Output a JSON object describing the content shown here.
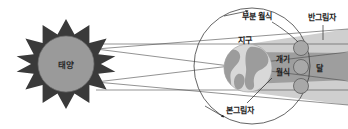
{
  "diagram": {
    "width": 348,
    "height": 129,
    "background_color": "#ffffff"
  },
  "labels": {
    "sun": "태양",
    "earth": "지구",
    "moon": "달",
    "partial_eclipse": "부분 월식",
    "penumbra": "반그림자",
    "total_eclipse_line1": "개기",
    "total_eclipse_line2": "월식",
    "umbra": "본그림자"
  },
  "colors": {
    "sun_spikes": "#3a3a3a",
    "sun_disc": "#9a9a9a",
    "earth_ocean": "#d8d8d8",
    "earth_land": "#9c9c9c",
    "moon_fill": "#a8a8a8",
    "moon_stroke": "#5a5a5a",
    "penumbra_band": "#cfcfcf",
    "umbra_band": "#9e9e9e",
    "ray_line": "#4a4a4a",
    "orbit_line": "#3d3d3d",
    "text": "#1c1c1c"
  },
  "bodies": {
    "sun": {
      "cx": 66,
      "cy": 64,
      "r": 30,
      "spikes": 10
    },
    "earth": {
      "cx": 248,
      "cy": 68,
      "r": 24
    },
    "moon_orbit": {
      "cx": 252,
      "cy": 66,
      "r": 58
    },
    "moons": [
      {
        "name": "moon-partial-upper",
        "cx": 301,
        "cy": 48,
        "r": 7.5
      },
      {
        "name": "moon-total",
        "cx": 301,
        "cy": 67,
        "r": 7.5
      },
      {
        "name": "moon-partial-lower",
        "cx": 301,
        "cy": 86,
        "r": 7.5
      }
    ]
  },
  "shadow_regions": [
    {
      "name": "penumbra-upper",
      "fill": "#cfcfcf"
    },
    {
      "name": "umbra-core",
      "fill": "#9e9e9e"
    },
    {
      "name": "penumbra-lower",
      "fill": "#cfcfcf"
    }
  ]
}
